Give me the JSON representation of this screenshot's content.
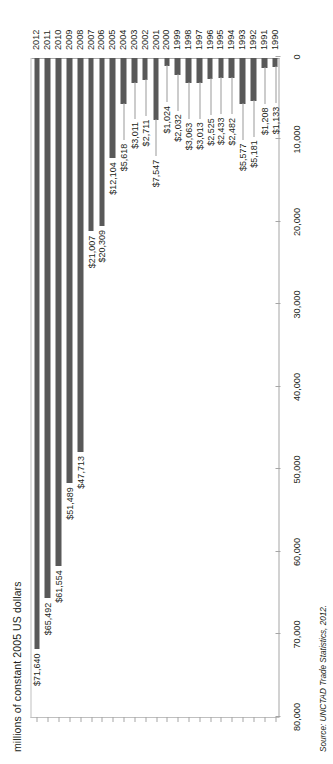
{
  "figure": {
    "axis_title": "millions of constant 2005 US dollars",
    "source": "Source: UNCTAD Trade Statistics, 2012."
  },
  "chart_data": {
    "type": "bar",
    "orientation": "vertical-on-page",
    "title": "",
    "subtitle": "",
    "xlabel": "",
    "ylabel": "millions of constant 2005 US dollars",
    "ylim": [
      0,
      80000
    ],
    "ytick_labels": [
      "0",
      "10,000",
      "20,000",
      "30,000",
      "40,000",
      "50,000",
      "60,000",
      "70,000",
      "80,000"
    ],
    "ytick_values": [
      0,
      10000,
      20000,
      30000,
      40000,
      50000,
      60000,
      70000,
      80000
    ],
    "grid": false,
    "legend": "none",
    "bar_color": "#595959",
    "categories": [
      "1990",
      "1991",
      "1992",
      "1993",
      "1994",
      "1995",
      "1996",
      "1997",
      "1998",
      "1999",
      "2000",
      "2001",
      "2002",
      "2003",
      "2004",
      "2005",
      "2006",
      "2007",
      "2008",
      "2009",
      "2010",
      "2011",
      "2012"
    ],
    "values": [
      1133,
      1208,
      5181,
      5577,
      2482,
      2433,
      2525,
      3013,
      3063,
      2032,
      1024,
      7547,
      2711,
      3011,
      5618,
      12104,
      20309,
      21007,
      47713,
      51489,
      61554,
      65492,
      71640
    ],
    "data_labels": [
      "$1,133",
      "$1,208",
      "$5,181",
      "$5,577",
      "$2,482",
      "$2,433",
      "$2,525",
      "$3,013",
      "$3,063",
      "$2,032",
      "$1,024",
      "$7,547",
      "$2,711",
      "$3,011",
      "$5,618",
      "$12,104",
      "$20,309",
      "$21,007",
      "$47,713",
      "$51,489",
      "$61,554",
      "$65,492",
      "$71,640"
    ],
    "annotations": []
  }
}
